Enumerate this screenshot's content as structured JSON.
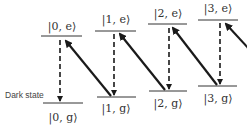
{
  "diagram": {
    "excited_states": [
      {
        "label": "|0, e⟩"
      },
      {
        "label": "|1, e⟩"
      },
      {
        "label": "|2, e⟩"
      },
      {
        "label": "|3, e⟩"
      }
    ],
    "ground_states": [
      {
        "label": "|0, g⟩"
      },
      {
        "label": "|1, g⟩"
      },
      {
        "label": "|2, g⟩"
      },
      {
        "label": "|3, g⟩"
      }
    ],
    "dark_state_label": "Dark state",
    "colors": {
      "line": "#1a1a1a",
      "text": "#333333"
    }
  }
}
